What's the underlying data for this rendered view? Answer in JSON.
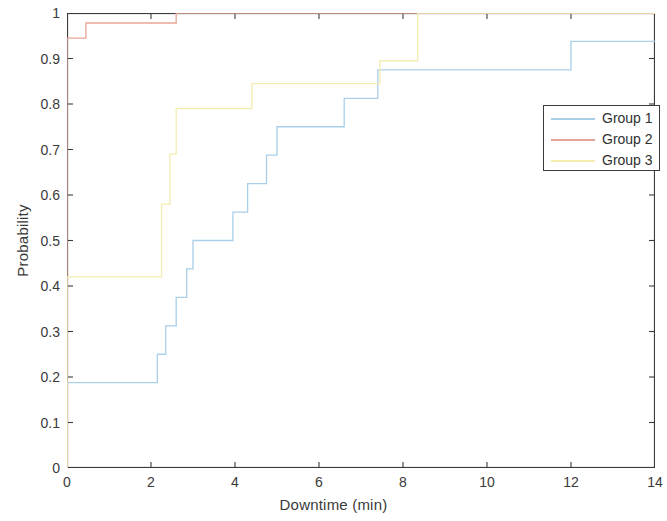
{
  "chart_data": {
    "type": "line",
    "subtype": "ecdf-step",
    "title": "",
    "xlabel": "Downtime (min)",
    "ylabel": "Probability",
    "xlim": [
      0,
      14
    ],
    "ylim": [
      0,
      1
    ],
    "xticks": [
      0,
      2,
      4,
      6,
      8,
      10,
      12,
      14
    ],
    "xtick_labels": [
      "0",
      "2",
      "4",
      "6",
      "8",
      "10",
      "12",
      "14"
    ],
    "yticks": [
      0,
      0.1,
      0.2,
      0.3,
      0.4,
      0.5,
      0.6,
      0.7,
      0.8,
      0.9,
      1
    ],
    "ytick_labels": [
      "0",
      "0.1",
      "0.2",
      "0.3",
      "0.4",
      "0.5",
      "0.6",
      "0.7",
      "0.8",
      "0.9",
      "1"
    ],
    "grid": false,
    "legend_position": "upper right",
    "series": [
      {
        "name": "Group 1",
        "color": "#a9cfe9",
        "x": [
          0,
          0,
          2.15,
          2.15,
          2.35,
          2.35,
          2.6,
          2.6,
          2.85,
          2.85,
          3.0,
          3.0,
          3.95,
          3.95,
          4.3,
          4.3,
          4.75,
          4.75,
          5.0,
          5.0,
          5.25,
          5.25,
          6.6,
          6.6,
          7.4,
          7.4,
          12.0,
          12.0,
          14.0
        ],
        "y": [
          0,
          0.1875,
          0.1875,
          0.25,
          0.25,
          0.3125,
          0.3125,
          0.375,
          0.375,
          0.4375,
          0.4375,
          0.5,
          0.5,
          0.5625,
          0.5625,
          0.625,
          0.625,
          0.6875,
          0.6875,
          0.75,
          0.75,
          0.75,
          0.75,
          0.8125,
          0.8125,
          0.875,
          0.875,
          0.9375,
          0.9375
        ]
      },
      {
        "name": "Group 2",
        "color": "#e7a595",
        "x": [
          0,
          0,
          0.45,
          0.45,
          2.6,
          2.6,
          14.0
        ],
        "y": [
          0,
          0.945,
          0.945,
          0.978,
          0.978,
          1.0,
          1.0
        ]
      },
      {
        "name": "Group 3",
        "color": "#f4ecb0",
        "x": [
          0,
          0,
          0,
          2.25,
          2.25,
          2.45,
          2.45,
          2.6,
          2.6,
          4.4,
          4.4,
          5.5,
          5.5,
          7.45,
          7.45,
          8.35,
          8.35,
          14.0
        ],
        "y": [
          0,
          0.315,
          0.42,
          0.42,
          0.58,
          0.58,
          0.69,
          0.69,
          0.79,
          0.79,
          0.845,
          0.845,
          0.845,
          0.845,
          0.895,
          0.895,
          1.0,
          1.0
        ]
      }
    ]
  },
  "legend": {
    "entries": [
      {
        "label": "Group 1",
        "color": "#a9cfe9"
      },
      {
        "label": "Group 2",
        "color": "#e7a595"
      },
      {
        "label": "Group 3",
        "color": "#f4ecb0"
      }
    ]
  },
  "axes": {
    "x_title": "Downtime (min)",
    "y_title": "Probability",
    "axis_color": "#3b3b3b"
  }
}
